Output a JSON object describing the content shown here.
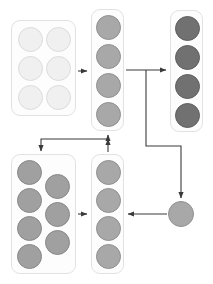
{
  "diagram": {
    "canvas": {
      "width": 213,
      "height": 284,
      "background": "#ffffff"
    },
    "palette": {
      "box_fill": "#fdfdfd",
      "box_stroke": "#e2e2e2",
      "edge_stroke": "#3a3a3a",
      "circle_lightest": "#f0f0f0",
      "circle_lightest_stroke": "#dcdcdc",
      "circle_medium": "#a8a8a8",
      "circle_medium_stroke": "#8f8f8f",
      "circle_mid_light": "#a0a0a0",
      "circle_mid_light_stroke": "#888888",
      "circle_dark": "#717171",
      "circle_dark_stroke": "#5e5e5e"
    },
    "groups": [
      {
        "id": "group-input-pool",
        "label": "input-pool",
        "x": 11,
        "y": 20,
        "w": 65,
        "h": 96,
        "circle_fill": "#f0f0f0",
        "circle_stroke": "#dcdcdc",
        "circle_size": 25,
        "nodes": [
          {
            "label": "node-1",
            "x": 6,
            "y": 6
          },
          {
            "label": "node-2",
            "x": 34,
            "y": 6
          },
          {
            "label": "node-3",
            "x": 6,
            "y": 35
          },
          {
            "label": "node-4",
            "x": 34,
            "y": 35
          },
          {
            "label": "node-5",
            "x": 6,
            "y": 64
          },
          {
            "label": "node-6",
            "x": 34,
            "y": 64
          }
        ]
      },
      {
        "id": "group-stage-two",
        "label": "stage-two-column",
        "x": 91,
        "y": 9,
        "w": 33,
        "h": 122,
        "circle_fill": "#a8a8a8",
        "circle_stroke": "#8f8f8f",
        "circle_size": 25,
        "nodes": [
          {
            "label": "node-1",
            "x": 4,
            "y": 5
          },
          {
            "label": "node-2",
            "x": 4,
            "y": 34
          },
          {
            "label": "node-3",
            "x": 4,
            "y": 63
          },
          {
            "label": "node-4",
            "x": 4,
            "y": 92
          }
        ]
      },
      {
        "id": "group-stage-three",
        "label": "stage-three-column",
        "x": 170,
        "y": 10,
        "w": 33,
        "h": 122,
        "circle_fill": "#717171",
        "circle_stroke": "#5e5e5e",
        "circle_size": 25,
        "nodes": [
          {
            "label": "node-1",
            "x": 4,
            "y": 5
          },
          {
            "label": "node-2",
            "x": 4,
            "y": 34
          },
          {
            "label": "node-3",
            "x": 4,
            "y": 63
          },
          {
            "label": "node-4",
            "x": 4,
            "y": 92
          }
        ]
      },
      {
        "id": "group-staggered-pool",
        "label": "staggered-pool",
        "x": 11,
        "y": 154,
        "w": 65,
        "h": 120,
        "circle_fill": "#a0a0a0",
        "circle_stroke": "#888888",
        "circle_size": 25,
        "nodes": [
          {
            "label": "node-1",
            "x": 5,
            "y": 5
          },
          {
            "label": "node-2",
            "x": 33,
            "y": 19
          },
          {
            "label": "node-3",
            "x": 5,
            "y": 33
          },
          {
            "label": "node-4",
            "x": 33,
            "y": 47
          },
          {
            "label": "node-5",
            "x": 5,
            "y": 61
          },
          {
            "label": "node-6",
            "x": 33,
            "y": 75
          },
          {
            "label": "node-7",
            "x": 5,
            "y": 89
          }
        ]
      },
      {
        "id": "group-stage-five",
        "label": "stage-five-column",
        "x": 91,
        "y": 154,
        "w": 33,
        "h": 120,
        "circle_fill": "#a8a8a8",
        "circle_stroke": "#8f8f8f",
        "circle_size": 25,
        "nodes": [
          {
            "label": "node-1",
            "x": 4,
            "y": 5
          },
          {
            "label": "node-2",
            "x": 4,
            "y": 33
          },
          {
            "label": "node-3",
            "x": 4,
            "y": 61
          },
          {
            "label": "node-4",
            "x": 4,
            "y": 89
          }
        ]
      }
    ],
    "standalone_nodes": [
      {
        "id": "node-aggregate",
        "label": "aggregate-node",
        "cx": 181,
        "cy": 214,
        "r": 13,
        "fill": "#a8a8a8",
        "stroke": "#8f8f8f"
      }
    ],
    "edges": [
      {
        "id": "edge-pool-to-stage-two",
        "label": "input-pool to stage-two",
        "d": "M 78 71 L 87 71"
      },
      {
        "id": "edge-stage-two-to-branch",
        "label": "stage-two to branch point",
        "d": "M 126 70 L 166 70"
      },
      {
        "id": "edge-branch-down-to-aggregate",
        "label": "branch down right to aggregate",
        "d": "M 146 70 L 146 146 L 181 146 L 181 198"
      },
      {
        "id": "edge-aggregate-to-stage-five",
        "label": "aggregate to stage-five",
        "d": "M 167 214 L 128 214"
      },
      {
        "id": "edge-staggered-to-stage-five",
        "label": "staggered-pool to stage-five",
        "d": "M 78 214 L 87 214"
      },
      {
        "id": "edge-stage-five-feedback",
        "label": "stage-five feedback up",
        "d": "M 108 152 L 108 139"
      },
      {
        "id": "edge-feedback-to-stage-two",
        "label": "feedback into stage-two",
        "d": "M 108 139 L 108 135"
      },
      {
        "id": "edge-feedback-to-staggered",
        "label": "feedback into staggered-pool",
        "d": "M 108 139 L 41 139 L 41 151"
      }
    ]
  }
}
